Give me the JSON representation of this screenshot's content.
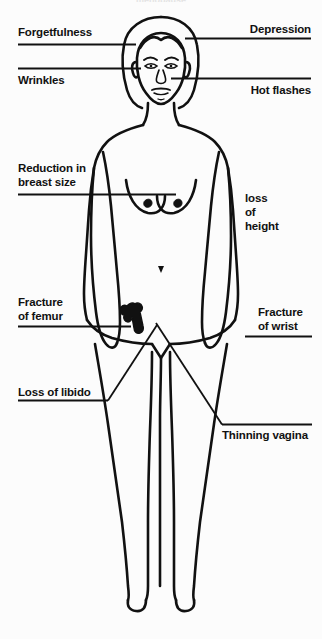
{
  "diagram": {
    "title_partial": "menopause",
    "background_color": "#fcfcfc",
    "line_color": "#111111"
  },
  "labels": {
    "forgetfulness": "Forgetfulness",
    "wrinkles": "Wrinkles",
    "depression": "Depression",
    "hot_flashes": "Hot flashes",
    "breast_reduction_line1": "Reduction in",
    "breast_reduction_line2": "breast size",
    "loss_of_height_line1": "loss",
    "loss_of_height_line2": "of",
    "loss_of_height_line3": "height",
    "fracture_femur_line1": "Fracture",
    "fracture_femur_line2": "of femur",
    "fracture_wrist_line1": "Fracture",
    "fracture_wrist_line2": "of wrist",
    "loss_of_libido": "Loss of libido",
    "thinning_vagina": "Thinning vagina"
  }
}
